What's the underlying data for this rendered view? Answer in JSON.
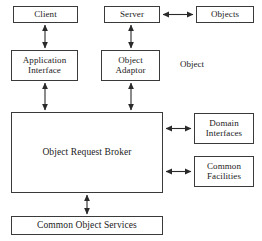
{
  "diagram": {
    "stroke_color": "#3a3a3a",
    "background_color": "#ffffff",
    "text_color": "#1a1a1a",
    "nodes": {
      "client": {
        "label": "Client"
      },
      "server": {
        "label": "Server"
      },
      "objects": {
        "label": "Objects"
      },
      "application_interface": {
        "line1": "Application",
        "line2": "Interface"
      },
      "object_adaptor": {
        "line1": "Object",
        "line2": "Adaptor"
      },
      "object_request_broker": {
        "label": "Object Request Broker"
      },
      "domain_interfaces": {
        "line1": "Domain",
        "line2": "Interfaces"
      },
      "common_facilities": {
        "line1": "Common",
        "line2": "Facilities"
      },
      "common_object_services": {
        "label": "Common Object Services"
      }
    },
    "free_labels": {
      "object": "Object"
    },
    "connectors": [
      {
        "name": "client-to-application-interface",
        "style": "double-headed"
      },
      {
        "name": "server-to-object-adaptor",
        "style": "double-headed"
      },
      {
        "name": "server-to-objects",
        "style": "double-headed"
      },
      {
        "name": "application-interface-to-orb",
        "style": "double-headed"
      },
      {
        "name": "object-adaptor-to-orb",
        "style": "double-headed"
      },
      {
        "name": "orb-to-domain-interfaces",
        "style": "double-headed"
      },
      {
        "name": "orb-to-common-facilities",
        "style": "double-headed"
      },
      {
        "name": "orb-to-common-object-services",
        "style": "double-headed"
      }
    ]
  }
}
